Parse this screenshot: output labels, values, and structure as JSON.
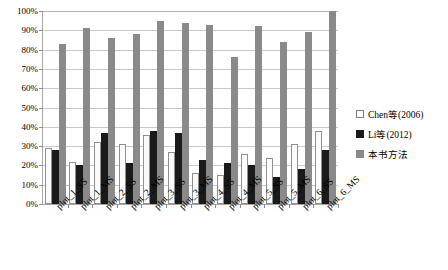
{
  "chart_data": {
    "type": "bar",
    "title": "",
    "xlabel": "",
    "ylabel": "",
    "ylim": [
      0,
      100
    ],
    "grid": true,
    "legend_position": "right",
    "ytick_labels": [
      "100%",
      "90%",
      "80%",
      "70%",
      "60%",
      "50%",
      "40%",
      "30%",
      "20%",
      "10%",
      "0%"
    ],
    "ytick_values": [
      100,
      90,
      80,
      70,
      60,
      50,
      40,
      30,
      20,
      10,
      0
    ],
    "categories": [
      "plot_1_SS",
      "plot_1_MS",
      "plot_2_SS",
      "plot_2_MS",
      "plot_3_SS",
      "plot_3_MS",
      "plot_4_SS",
      "plot_4_MS",
      "plot_5_SS",
      "plot_5_MS",
      "plot_6_SS",
      "plot_6_MS"
    ],
    "series": [
      {
        "name": "Chen等(2006)",
        "color": "#fbfbfb",
        "values": [
          29,
          22,
          32,
          31,
          36,
          27,
          16,
          15,
          26,
          24,
          31,
          38
        ]
      },
      {
        "name": "Li等(2012)",
        "color": "#1a1a1a",
        "values": [
          28,
          20,
          37,
          21,
          38,
          37,
          23,
          21,
          20,
          14,
          18,
          28
        ]
      },
      {
        "name": "本书方法",
        "color": "#8a8a8a",
        "values": [
          83,
          91,
          86,
          88,
          95,
          94,
          93,
          76,
          92,
          84,
          89,
          100
        ]
      }
    ]
  },
  "legend": {
    "items": [
      {
        "label": "Chen等(2006)"
      },
      {
        "label": "Li等(2012)"
      },
      {
        "label": "本书方法"
      }
    ]
  }
}
